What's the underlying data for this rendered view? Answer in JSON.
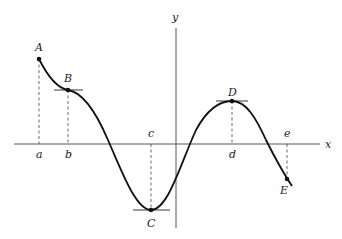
{
  "diagram": {
    "type": "function-graph",
    "axes": {
      "x_label": "x",
      "y_label": "y"
    },
    "points": [
      {
        "id": "A",
        "label": "A",
        "x_label": "a",
        "kind": "endpoint-maximum"
      },
      {
        "id": "B",
        "label": "B",
        "x_label": "b",
        "kind": "horizontal-tangent"
      },
      {
        "id": "C",
        "label": "C",
        "x_label": "c",
        "kind": "minimum-horizontal-tangent"
      },
      {
        "id": "D",
        "label": "D",
        "x_label": "d",
        "kind": "maximum-horizontal-tangent"
      },
      {
        "id": "E",
        "label": "E",
        "x_label": "e",
        "kind": "endpoint"
      }
    ]
  }
}
